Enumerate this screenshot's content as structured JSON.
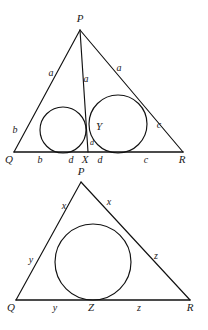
{
  "figure": {
    "background_color": "#ffffff",
    "ink_color": "#111111",
    "panels": [
      {
        "id": "upper",
        "name": "triangle-with-two-inscribed-circles",
        "vertices": [
          {
            "label": "P",
            "x": 80,
            "y": 30
          },
          {
            "label": "Q",
            "x": 14,
            "y": 152
          },
          {
            "label": "R",
            "x": 183,
            "y": 152
          }
        ],
        "foot_point": {
          "label": "X",
          "x": 88,
          "y": 152
        },
        "touch_point": {
          "label": "Y",
          "x": 94,
          "y": 131
        },
        "cevian": {
          "from": "P",
          "to": "X"
        },
        "circles": [
          {
            "name": "left-incircle",
            "cx": 63,
            "cy": 130,
            "r": 23
          },
          {
            "name": "right-incircle",
            "cx": 118,
            "cy": 124,
            "r": 29
          }
        ],
        "labels": [
          {
            "text": "P",
            "x": 80,
            "y": 22,
            "kind": "vertex"
          },
          {
            "text": "Q",
            "x": 9,
            "y": 163,
            "kind": "vertex"
          },
          {
            "text": "R",
            "x": 182,
            "y": 163,
            "kind": "vertex"
          },
          {
            "text": "X",
            "x": 85,
            "y": 163,
            "kind": "vertex"
          },
          {
            "text": "Y",
            "x": 96,
            "y": 130,
            "kind": "vertex"
          },
          {
            "text": "a",
            "x": 51,
            "y": 76,
            "kind": "side"
          },
          {
            "text": "a",
            "x": 86,
            "y": 82,
            "kind": "side"
          },
          {
            "text": "a",
            "x": 119,
            "y": 71,
            "kind": "side"
          },
          {
            "text": "b",
            "x": 15,
            "y": 133,
            "kind": "side"
          },
          {
            "text": "c",
            "x": 159,
            "y": 128,
            "kind": "side"
          },
          {
            "text": "b",
            "x": 40,
            "y": 163,
            "kind": "side"
          },
          {
            "text": "d",
            "x": 71,
            "y": 163,
            "kind": "side"
          },
          {
            "text": "d",
            "x": 100,
            "y": 163,
            "kind": "side"
          },
          {
            "text": "c",
            "x": 146,
            "y": 163,
            "kind": "side"
          },
          {
            "text": "d",
            "x": 92,
            "y": 145,
            "kind": "small"
          }
        ]
      },
      {
        "id": "lower",
        "name": "triangle-with-single-incircle",
        "vertices": [
          {
            "label": "P",
            "x": 81,
            "y": 182
          },
          {
            "label": "Q",
            "x": 16,
            "y": 300
          },
          {
            "label": "R",
            "x": 190,
            "y": 300
          }
        ],
        "touch_point": {
          "label": "Z",
          "x": 93,
          "y": 300
        },
        "circles": [
          {
            "name": "incircle",
            "cx": 93,
            "cy": 262,
            "r": 38
          }
        ],
        "labels": [
          {
            "text": "P",
            "x": 81,
            "y": 175,
            "kind": "vertex"
          },
          {
            "text": "Q",
            "x": 11,
            "y": 311,
            "kind": "vertex"
          },
          {
            "text": "R",
            "x": 190,
            "y": 311,
            "kind": "vertex"
          },
          {
            "text": "Z",
            "x": 91,
            "y": 311,
            "kind": "vertex"
          },
          {
            "text": "x",
            "x": 64,
            "y": 209,
            "kind": "side"
          },
          {
            "text": "x",
            "x": 109,
            "y": 205,
            "kind": "side"
          },
          {
            "text": "y",
            "x": 31,
            "y": 263,
            "kind": "side"
          },
          {
            "text": "z",
            "x": 156,
            "y": 259,
            "kind": "side"
          },
          {
            "text": "y",
            "x": 55,
            "y": 311,
            "kind": "side"
          },
          {
            "text": "z",
            "x": 139,
            "y": 311,
            "kind": "side"
          }
        ]
      }
    ]
  }
}
